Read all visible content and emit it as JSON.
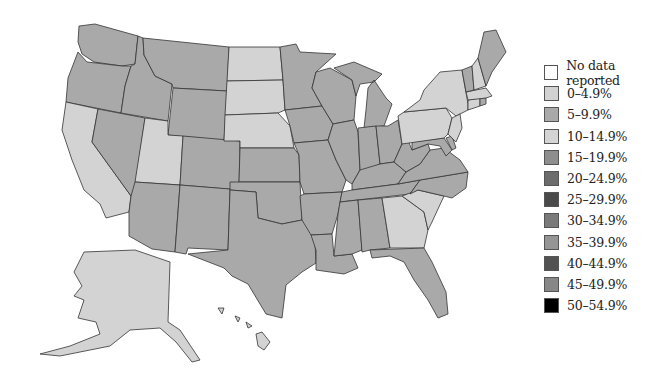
{
  "caption": "",
  "legend": {
    "items": [
      {
        "label": "No data reported",
        "color": "#ffffff"
      },
      {
        "label": "0–4.9%",
        "color": "#d2d2d2"
      },
      {
        "label": "5–9.9%",
        "color": "#a9a9a9"
      },
      {
        "label": "10–14.9%",
        "color": "#d4d4d4"
      },
      {
        "label": "15–19.9%",
        "color": "#8e8e8e"
      },
      {
        "label": "20–24.9%",
        "color": "#6c6c6c"
      },
      {
        "label": "25–29.9%",
        "color": "#4a4a4a"
      },
      {
        "label": "30–34.9%",
        "color": "#7a7a7a"
      },
      {
        "label": "35–39.9%",
        "color": "#959595"
      },
      {
        "label": "40–44.9%",
        "color": "#525252"
      },
      {
        "label": "45–49.9%",
        "color": "#878787"
      },
      {
        "label": "50–54.9%",
        "color": "#000000"
      }
    ]
  },
  "map": {
    "colors": {
      "low": "#d3d3d3",
      "mid": "#a9a9a9"
    },
    "states": {
      "WA": "mid",
      "OR": "mid",
      "CA": "low",
      "NV": "mid",
      "ID": "mid",
      "MT": "mid",
      "WY": "mid",
      "UT": "low",
      "AZ": "mid",
      "CO": "mid",
      "NM": "mid",
      "ND": "low",
      "SD": "low",
      "NE": "low",
      "KS": "mid",
      "OK": "mid",
      "TX": "mid",
      "MN": "mid",
      "IA": "mid",
      "MO": "mid",
      "AR": "mid",
      "LA": "mid",
      "WI": "mid",
      "IL": "mid",
      "MI": "mid",
      "IN": "mid",
      "OH": "mid",
      "KY": "mid",
      "TN": "mid",
      "MS": "mid",
      "AL": "mid",
      "GA": "low",
      "FL": "mid",
      "SC": "low",
      "NC": "mid",
      "VA": "mid",
      "WV": "mid",
      "MD": "mid",
      "DE": "mid",
      "PA": "low",
      "NY": "low",
      "NJ": "low",
      "CT": "low",
      "RI": "mid",
      "MA": "low",
      "VT": "mid",
      "NH": "low",
      "ME": "mid",
      "AK": "low",
      "HI": "low"
    }
  }
}
